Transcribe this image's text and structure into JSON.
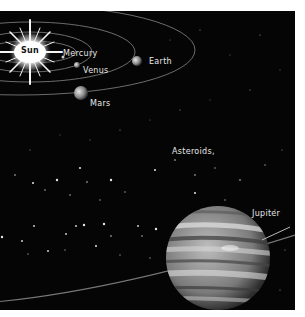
{
  "scene": {
    "type": "solar-system-illustration",
    "background_color": "#050505",
    "labels": {
      "sun": "Sun",
      "mercury": "Mercury",
      "venus": "Venus",
      "earth": "Earth",
      "mars": "Mars",
      "asteroids": "Asteroids,",
      "jupiter": "Jupiter"
    }
  }
}
